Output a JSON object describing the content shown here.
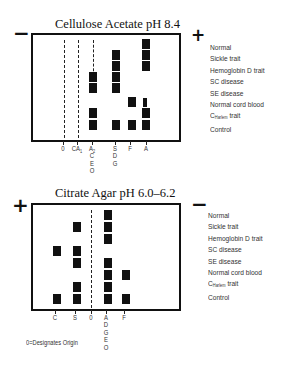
{
  "panels": [
    {
      "title": "Cellulose Acetate pH 8.4",
      "left_sign": "−",
      "right_sign": "+",
      "lanes": [
        {
          "label": "O",
          "sub_labels": []
        },
        {
          "label": "CA1",
          "sub_labels": []
        },
        {
          "label": "A2",
          "sub_labels": [
            "C",
            "E",
            "O"
          ]
        },
        {
          "label": "S",
          "sub_labels": [
            "D",
            "G"
          ]
        },
        {
          "label": "F",
          "sub_labels": []
        },
        {
          "label": "A",
          "sub_labels": []
        }
      ],
      "rows": [
        "Normal",
        "Sickle trait",
        "Hemoglobin D trait",
        "SC disease",
        "SE disease",
        "Normal cord blood",
        "C Harlem trait",
        "Control"
      ],
      "bands": {
        "Normal": [
          "A"
        ],
        "Sickle trait": [
          "S",
          "A"
        ],
        "Hemoglobin D trait": [
          "S",
          "A"
        ],
        "SC disease": [
          "A2",
          "S"
        ],
        "SE disease": [
          "A2",
          "S"
        ],
        "Normal cord blood": [
          "F",
          "A (faint)"
        ],
        "C Harlem trait": [
          "A2",
          "A"
        ],
        "Control": [
          "A2",
          "S",
          "F",
          "A"
        ]
      }
    },
    {
      "title": "Citrate Agar pH 6.0–6.2",
      "left_sign": "+",
      "right_sign": "−",
      "lanes": [
        {
          "label": "C",
          "sub_labels": []
        },
        {
          "label": "S",
          "sub_labels": []
        },
        {
          "label": "O",
          "sub_labels": []
        },
        {
          "label": "A",
          "sub_labels": [
            "D",
            "G",
            "E",
            "O"
          ]
        },
        {
          "label": "F",
          "sub_labels": []
        }
      ],
      "rows": [
        "Normal",
        "Sickle trait",
        "Hemoglobin D trait",
        "SC disease",
        "SE disease",
        "Normal cord blood",
        "C Harlem trait",
        "Control"
      ],
      "bands": {
        "Normal": [
          "A"
        ],
        "Sickle trait": [
          "S",
          "A"
        ],
        "Hemoglobin D trait": [
          "A"
        ],
        "SC disease": [
          "C",
          "S"
        ],
        "SE disease": [
          "S",
          "A"
        ],
        "Normal cord blood": [
          "A",
          "F"
        ],
        "C Harlem trait": [
          "S",
          "A"
        ],
        "Control": [
          "C",
          "S",
          "A",
          "F"
        ]
      }
    }
  ],
  "legend_top": {
    "items": [
      "Normal",
      "Sickle trait",
      "Hemoglobin D trait",
      "SC disease",
      "SE disease",
      "Normal cord blood",
      "C",
      "Control"
    ],
    "c_harlem_sub": "Harlem",
    "c_harlem_suffix": " trait"
  },
  "legend_bottom": {
    "items": [
      "Normal",
      "Sickle trait",
      "Hemoglobin D trait",
      "SC disease",
      "SE disease",
      "Normal cord blood",
      "C",
      "Control"
    ],
    "c_harlem_sub": "Harlem",
    "c_harlem_suffix": " trait"
  },
  "top_labels": {
    "O": "0",
    "CA": "CA",
    "CA_sub": "1",
    "A2": "A",
    "A2_sub": "2",
    "A2_below": "C\nE\nO",
    "S": "S",
    "S_below": "D\nG",
    "F": "F",
    "A": "A"
  },
  "bottom_labels": {
    "C": "C",
    "S": "S",
    "O": "0",
    "A": "A",
    "A_below": "D\nG\nE\nO",
    "F": "F"
  },
  "footnote": "0=Designates Origin"
}
